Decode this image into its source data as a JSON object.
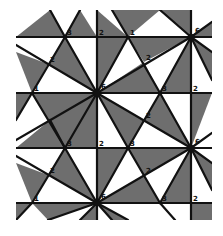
{
  "figure": {
    "clip": {
      "x": 16,
      "y": 10,
      "w": 196,
      "h": 210
    },
    "colors": {
      "shade": "#6e6e6e",
      "line": "#111111",
      "background": "#ffffff"
    },
    "horizontal_lines_y": [
      37,
      93,
      148,
      203
    ],
    "vertical_lines_x": [
      97,
      191
    ],
    "hubs": [
      {
        "x": 97,
        "y": 93,
        "label": "6"
      },
      {
        "x": 191,
        "y": 37,
        "label": "6"
      },
      {
        "x": 191,
        "y": 148,
        "label": "6"
      },
      {
        "x": 97,
        "y": 203,
        "label": "6"
      },
      {
        "x": 3,
        "y": 37,
        "label": ""
      },
      {
        "x": 3,
        "y": 148,
        "label": ""
      }
    ],
    "vertex_labels": [
      {
        "x": 65,
        "y": 37,
        "text": "3"
      },
      {
        "x": 97,
        "y": 37,
        "text": "2"
      },
      {
        "x": 48,
        "y": 64,
        "text": "2"
      },
      {
        "x": 32,
        "y": 93,
        "text": "1"
      },
      {
        "x": 128,
        "y": 37,
        "text": "1"
      },
      {
        "x": 144,
        "y": 62,
        "text": "2"
      },
      {
        "x": 160,
        "y": 93,
        "text": "3"
      },
      {
        "x": 191,
        "y": 93,
        "text": "2"
      },
      {
        "x": 144,
        "y": 120,
        "text": "2"
      },
      {
        "x": 128,
        "y": 148,
        "text": "3"
      },
      {
        "x": 65,
        "y": 148,
        "text": "3"
      },
      {
        "x": 97,
        "y": 148,
        "text": "2"
      },
      {
        "x": 48,
        "y": 175,
        "text": "2"
      },
      {
        "x": 32,
        "y": 203,
        "text": "1"
      },
      {
        "x": 144,
        "y": 175,
        "text": "2"
      },
      {
        "x": 160,
        "y": 203,
        "text": "3"
      },
      {
        "x": 191,
        "y": 203,
        "text": "2"
      }
    ],
    "shaded_triangles": [
      [
        [
          16,
          37
        ],
        [
          50,
          10
        ],
        [
          65,
          37
        ]
      ],
      [
        [
          65,
          37
        ],
        [
          80,
          10
        ],
        [
          97,
          37
        ]
      ],
      [
        [
          97,
          37
        ],
        [
          97,
          10
        ],
        [
          128,
          37
        ]
      ],
      [
        [
          128,
          37
        ],
        [
          112,
          10
        ],
        [
          160,
          10
        ]
      ],
      [
        [
          160,
          10
        ],
        [
          191,
          37
        ],
        [
          191,
          10
        ]
      ],
      [
        [
          191,
          37
        ],
        [
          212,
          22
        ],
        [
          212,
          37
        ]
      ],
      [
        [
          16,
          52
        ],
        [
          48,
          64
        ],
        [
          32,
          93
        ]
      ],
      [
        [
          65,
          37
        ],
        [
          97,
          93
        ],
        [
          48,
          64
        ]
      ],
      [
        [
          97,
          37
        ],
        [
          97,
          93
        ],
        [
          128,
          37
        ]
      ],
      [
        [
          128,
          37
        ],
        [
          191,
          37
        ],
        [
          144,
          62
        ]
      ],
      [
        [
          144,
          62
        ],
        [
          97,
          93
        ],
        [
          160,
          93
        ]
      ],
      [
        [
          191,
          37
        ],
        [
          160,
          93
        ],
        [
          191,
          93
        ]
      ],
      [
        [
          191,
          37
        ],
        [
          212,
          52
        ],
        [
          212,
          80
        ]
      ],
      [
        [
          16,
          93
        ],
        [
          32,
          93
        ],
        [
          16,
          120
        ]
      ],
      [
        [
          97,
          93
        ],
        [
          32,
          93
        ],
        [
          65,
          148
        ]
      ],
      [
        [
          97,
          93
        ],
        [
          97,
          148
        ],
        [
          65,
          148
        ]
      ],
      [
        [
          97,
          93
        ],
        [
          144,
          120
        ],
        [
          128,
          148
        ]
      ],
      [
        [
          160,
          93
        ],
        [
          191,
          148
        ],
        [
          144,
          120
        ]
      ],
      [
        [
          191,
          93
        ],
        [
          191,
          148
        ],
        [
          212,
          93
        ]
      ],
      [
        [
          16,
          148
        ],
        [
          65,
          148
        ],
        [
          50,
          120
        ]
      ],
      [
        [
          16,
          163
        ],
        [
          48,
          175
        ],
        [
          32,
          203
        ]
      ],
      [
        [
          65,
          148
        ],
        [
          97,
          203
        ],
        [
          48,
          175
        ]
      ],
      [
        [
          97,
          148
        ],
        [
          97,
          203
        ],
        [
          128,
          148
        ]
      ],
      [
        [
          128,
          148
        ],
        [
          191,
          148
        ],
        [
          144,
          175
        ]
      ],
      [
        [
          144,
          175
        ],
        [
          97,
          203
        ],
        [
          160,
          203
        ]
      ],
      [
        [
          191,
          148
        ],
        [
          160,
          203
        ],
        [
          191,
          203
        ]
      ],
      [
        [
          191,
          148
        ],
        [
          212,
          163
        ],
        [
          212,
          190
        ]
      ],
      [
        [
          97,
          203
        ],
        [
          32,
          203
        ],
        [
          48,
          220
        ]
      ],
      [
        [
          97,
          203
        ],
        [
          97,
          220
        ],
        [
          80,
          220
        ]
      ],
      [
        [
          97,
          203
        ],
        [
          128,
          220
        ],
        [
          112,
          220
        ]
      ],
      [
        [
          191,
          203
        ],
        [
          212,
          203
        ],
        [
          212,
          220
        ],
        [
          191,
          220
        ]
      ],
      [
        [
          16,
          203
        ],
        [
          32,
          203
        ],
        [
          16,
          220
        ]
      ]
    ],
    "edges": [
      [
        [
          16,
          37
        ],
        [
          212,
          37
        ]
      ],
      [
        [
          16,
          93
        ],
        [
          212,
          93
        ]
      ],
      [
        [
          16,
          148
        ],
        [
          212,
          148
        ]
      ],
      [
        [
          16,
          203
        ],
        [
          212,
          203
        ]
      ],
      [
        [
          97,
          10
        ],
        [
          97,
          220
        ]
      ],
      [
        [
          191,
          10
        ],
        [
          191,
          220
        ]
      ],
      [
        [
          50,
          10
        ],
        [
          65,
          37
        ]
      ],
      [
        [
          65,
          37
        ],
        [
          97,
          93
        ]
      ],
      [
        [
          65,
          37
        ],
        [
          32,
          93
        ]
      ],
      [
        [
          32,
          93
        ],
        [
          16,
          120
        ]
      ],
      [
        [
          16,
          45
        ],
        [
          97,
          93
        ]
      ],
      [
        [
          80,
          10
        ],
        [
          65,
          37
        ]
      ],
      [
        [
          112,
          10
        ],
        [
          128,
          37
        ]
      ],
      [
        [
          128,
          37
        ],
        [
          97,
          93
        ]
      ],
      [
        [
          128,
          37
        ],
        [
          160,
          93
        ]
      ],
      [
        [
          160,
          93
        ],
        [
          191,
          148
        ]
      ],
      [
        [
          160,
          10
        ],
        [
          191,
          37
        ]
      ],
      [
        [
          191,
          37
        ],
        [
          97,
          93
        ]
      ],
      [
        [
          191,
          37
        ],
        [
          160,
          93
        ]
      ],
      [
        [
          191,
          37
        ],
        [
          212,
          22
        ]
      ],
      [
        [
          191,
          37
        ],
        [
          212,
          52
        ]
      ],
      [
        [
          191,
          37
        ],
        [
          212,
          80
        ]
      ],
      [
        [
          97,
          93
        ],
        [
          191,
          148
        ]
      ],
      [
        [
          97,
          93
        ],
        [
          65,
          148
        ]
      ],
      [
        [
          97,
          93
        ],
        [
          128,
          148
        ]
      ],
      [
        [
          97,
          93
        ],
        [
          16,
          140
        ]
      ],
      [
        [
          160,
          93
        ],
        [
          128,
          148
        ]
      ],
      [
        [
          32,
          93
        ],
        [
          65,
          148
        ]
      ],
      [
        [
          65,
          148
        ],
        [
          97,
          203
        ]
      ],
      [
        [
          65,
          148
        ],
        [
          32,
          203
        ]
      ],
      [
        [
          16,
          156
        ],
        [
          97,
          203
        ]
      ],
      [
        [
          50,
          120
        ],
        [
          65,
          148
        ]
      ],
      [
        [
          128,
          148
        ],
        [
          97,
          203
        ]
      ],
      [
        [
          128,
          148
        ],
        [
          160,
          203
        ]
      ],
      [
        [
          160,
          203
        ],
        [
          191,
          148
        ]
      ],
      [
        [
          191,
          148
        ],
        [
          97,
          203
        ]
      ],
      [
        [
          191,
          148
        ],
        [
          212,
          133
        ]
      ],
      [
        [
          191,
          148
        ],
        [
          212,
          163
        ]
      ],
      [
        [
          191,
          148
        ],
        [
          212,
          190
        ]
      ],
      [
        [
          97,
          203
        ],
        [
          48,
          220
        ]
      ],
      [
        [
          97,
          203
        ],
        [
          128,
          220
        ]
      ],
      [
        [
          97,
          203
        ],
        [
          80,
          220
        ]
      ],
      [
        [
          97,
          203
        ],
        [
          112,
          220
        ]
      ],
      [
        [
          32,
          203
        ],
        [
          16,
          220
        ]
      ],
      [
        [
          160,
          203
        ],
        [
          175,
          220
        ]
      ]
    ]
  }
}
